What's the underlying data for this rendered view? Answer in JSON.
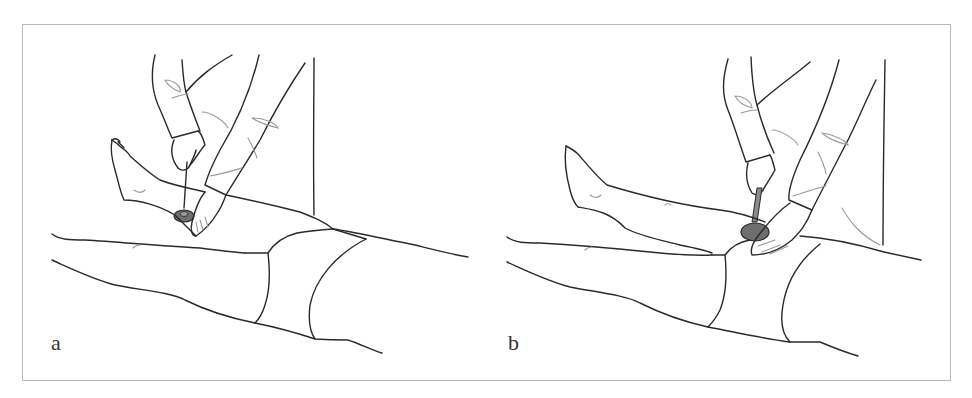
{
  "figure": {
    "panels": [
      {
        "id": "a",
        "label": "a",
        "hammer_head_color": "#6e6e6e"
      },
      {
        "id": "b",
        "label": "b",
        "hammer_head_color": "#6e6e6e"
      }
    ],
    "frame_color": "#b8b8b8",
    "line_color": "#2a2a2a"
  }
}
